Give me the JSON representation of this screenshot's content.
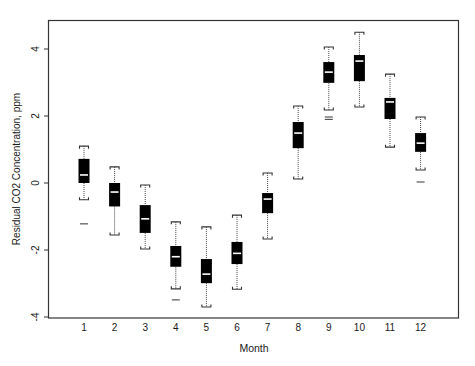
{
  "chart_data": {
    "type": "box",
    "title": "",
    "xlabel": "Month",
    "ylabel": "Residual CO2 Concentration, ppm",
    "ylim": [
      -4,
      4.6
    ],
    "yticks": [
      -4,
      -2,
      0,
      2,
      4
    ],
    "yticklabels": [
      "-4",
      "-2",
      "0",
      "2",
      "4"
    ],
    "categories": [
      "1",
      "2",
      "3",
      "4",
      "5",
      "6",
      "7",
      "8",
      "9",
      "10",
      "11",
      "12"
    ],
    "grid": false,
    "legend": null,
    "boxes": [
      {
        "month": "1",
        "whisker_high": 1.1,
        "q3": 0.72,
        "median": 0.24,
        "q1": 0.0,
        "whisker_low": -0.5,
        "outliers": [
          -1.22
        ]
      },
      {
        "month": "2",
        "whisker_high": 0.48,
        "q3": 0.0,
        "median": -0.27,
        "q1": -0.7,
        "whisker_low": -1.55,
        "outliers": []
      },
      {
        "month": "3",
        "whisker_high": -0.06,
        "q3": -0.66,
        "median": -1.07,
        "q1": -1.49,
        "whisker_low": -1.97,
        "outliers": []
      },
      {
        "month": "4",
        "whisker_high": -1.16,
        "q3": -1.88,
        "median": -2.2,
        "q1": -2.5,
        "whisker_low": -3.16,
        "outliers": [
          -3.49
        ]
      },
      {
        "month": "5",
        "whisker_high": -1.31,
        "q3": -2.27,
        "median": -2.72,
        "q1": -2.99,
        "whisker_low": -3.7,
        "outliers": []
      },
      {
        "month": "6",
        "whisker_high": -0.96,
        "q3": -1.76,
        "median": -2.1,
        "q1": -2.42,
        "whisker_low": -3.17,
        "outliers": []
      },
      {
        "month": "7",
        "whisker_high": 0.3,
        "q3": -0.3,
        "median": -0.48,
        "q1": -0.9,
        "whisker_low": -1.67,
        "outliers": []
      },
      {
        "month": "8",
        "whisker_high": 2.3,
        "q3": 1.82,
        "median": 1.49,
        "q1": 1.04,
        "whisker_low": 0.12,
        "outliers": []
      },
      {
        "month": "9",
        "whisker_high": 4.06,
        "q3": 3.61,
        "median": 3.31,
        "q1": 2.99,
        "whisker_low": 2.18,
        "outliers": [
          1.97,
          1.9
        ]
      },
      {
        "month": "10",
        "whisker_high": 4.5,
        "q3": 3.82,
        "median": 3.64,
        "q1": 3.04,
        "whisker_low": 2.27,
        "outliers": []
      },
      {
        "month": "11",
        "whisker_high": 3.25,
        "q3": 2.54,
        "median": 2.42,
        "q1": 1.91,
        "whisker_low": 1.07,
        "outliers": []
      },
      {
        "month": "12",
        "whisker_high": 1.97,
        "q3": 1.49,
        "median": 1.19,
        "q1": 0.93,
        "whisker_low": 0.39,
        "outliers": [
          0.03
        ]
      }
    ],
    "colors": {
      "box_fill": "#000000",
      "median_line": "#ffffff",
      "whisker": "#444444",
      "frame": "#333333"
    }
  }
}
